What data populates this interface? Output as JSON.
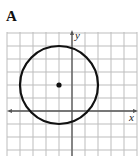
{
  "option_label": "A",
  "axes": {
    "x_label": "x",
    "y_label": "y"
  },
  "chart_data": {
    "type": "scatter",
    "title": "A",
    "xlabel": "x",
    "ylabel": "y",
    "grid": true,
    "xlim": [
      -5,
      5
    ],
    "ylim": [
      -3,
      6
    ],
    "grid_spacing": 1,
    "shapes": [
      {
        "type": "circle",
        "center": [
          -1,
          2
        ],
        "radius": 3
      }
    ],
    "points": [
      {
        "x": -1,
        "y": 2,
        "label": "center"
      }
    ]
  },
  "colors": {
    "grid": "#bdbdbd",
    "axis": "#555555",
    "curve": "#111111"
  }
}
